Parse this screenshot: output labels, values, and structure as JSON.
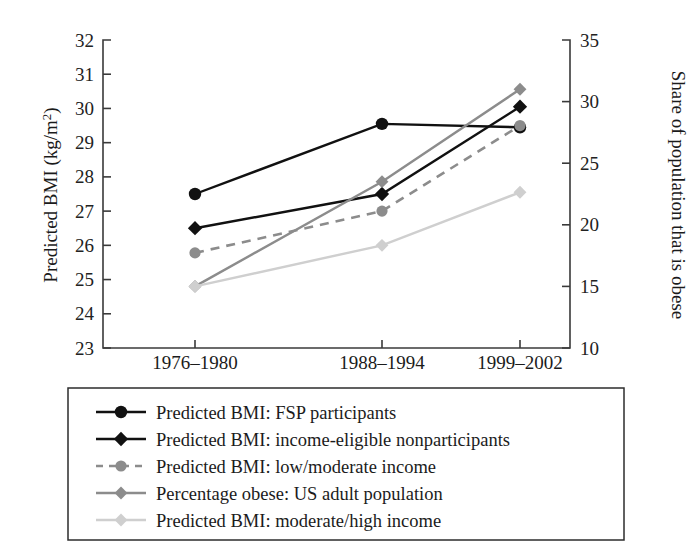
{
  "chart_data": {
    "type": "line",
    "title": "",
    "subtitle": "",
    "xlabel": "",
    "ylabel": "Predicted BMI (kg/m2)",
    "ylabel_parts": {
      "before": "Predicted BMI (kg/m",
      "superscript": "2",
      "after": ")"
    },
    "y2label": "Share of population that is obese",
    "categories": [
      "1976–1980",
      "1988–1994",
      "1999–2002"
    ],
    "ylim": [
      23,
      32
    ],
    "yticks": [
      23,
      24,
      25,
      26,
      27,
      28,
      29,
      30,
      31,
      32
    ],
    "y2lim": [
      10,
      35
    ],
    "y2ticks": [
      10,
      15,
      20,
      25,
      30,
      35
    ],
    "grid": false,
    "legend_position": "below-plot",
    "series": [
      {
        "name": "Predicted BMI: FSP participants",
        "axis": "left",
        "values": [
          27.5,
          29.55,
          29.45
        ],
        "color": "#111111",
        "marker": "circle",
        "linestyle": "solid"
      },
      {
        "name": "Predicted BMI: income-eligible nonparticipants",
        "axis": "left",
        "values": [
          26.5,
          27.5,
          30.05
        ],
        "color": "#111111",
        "marker": "diamond",
        "linestyle": "solid"
      },
      {
        "name": "Predicted BMI: low/moderate income",
        "axis": "left",
        "values": [
          25.78,
          27.0,
          29.5
        ],
        "color": "#8c8c8c",
        "marker": "circle",
        "linestyle": "dashed"
      },
      {
        "name": "Percentage obese: US adult population",
        "axis": "right",
        "values": [
          15.0,
          23.5,
          31.0
        ],
        "values_left_equivalent": [
          24.8,
          27.88,
          30.6
        ],
        "color": "#8c8c8c",
        "marker": "diamond",
        "linestyle": "solid"
      },
      {
        "name": "Predicted BMI: moderate/high income",
        "axis": "left",
        "values": [
          24.8,
          26.0,
          27.55
        ],
        "color": "#cfcfcf",
        "marker": "diamond",
        "linestyle": "solid"
      }
    ]
  },
  "legend": {
    "items": [
      {
        "label": "Predicted BMI: FSP participants",
        "color": "#111111",
        "marker": "circle",
        "linestyle": "solid"
      },
      {
        "label": "Predicted BMI: income-eligible nonparticipants",
        "color": "#111111",
        "marker": "diamond",
        "linestyle": "solid"
      },
      {
        "label": "Predicted BMI: low/moderate income",
        "color": "#8c8c8c",
        "marker": "circle",
        "linestyle": "dashed"
      },
      {
        "label": "Percentage obese: US adult population",
        "color": "#8c8c8c",
        "marker": "diamond",
        "linestyle": "solid"
      },
      {
        "label": "Predicted BMI: moderate/high income",
        "color": "#cfcfcf",
        "marker": "diamond",
        "linestyle": "solid"
      }
    ]
  },
  "axes": {
    "left_ticks": [
      "32",
      "31",
      "30",
      "29",
      "28",
      "27",
      "26",
      "25",
      "24",
      "23"
    ],
    "right_ticks": [
      "35",
      "30",
      "25",
      "20",
      "15",
      "10"
    ],
    "left_title": "Predicted BMI (kg/m",
    "left_title_sup": "2",
    "left_title_end": ")",
    "right_title": "Share of population that is obese",
    "x_categories": [
      "1976–1980",
      "1988–1994",
      "1999–2002"
    ]
  },
  "colors": {
    "axis": "#3a3a3a",
    "text": "#1b1b1b",
    "series_black": "#111111",
    "series_gray": "#8c8c8c",
    "series_light": "#cfcfcf"
  }
}
